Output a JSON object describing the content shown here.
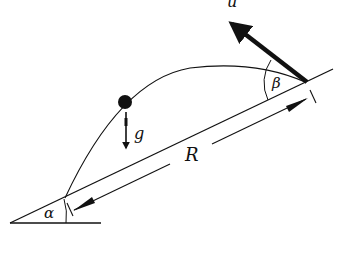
{
  "diagram": {
    "labels": {
      "velocity": "u",
      "gravity": "g",
      "range": "R",
      "incline_angle": "α",
      "launch_angle": "β"
    },
    "colors": {
      "stroke": "#111111",
      "background": "#ffffff"
    }
  }
}
